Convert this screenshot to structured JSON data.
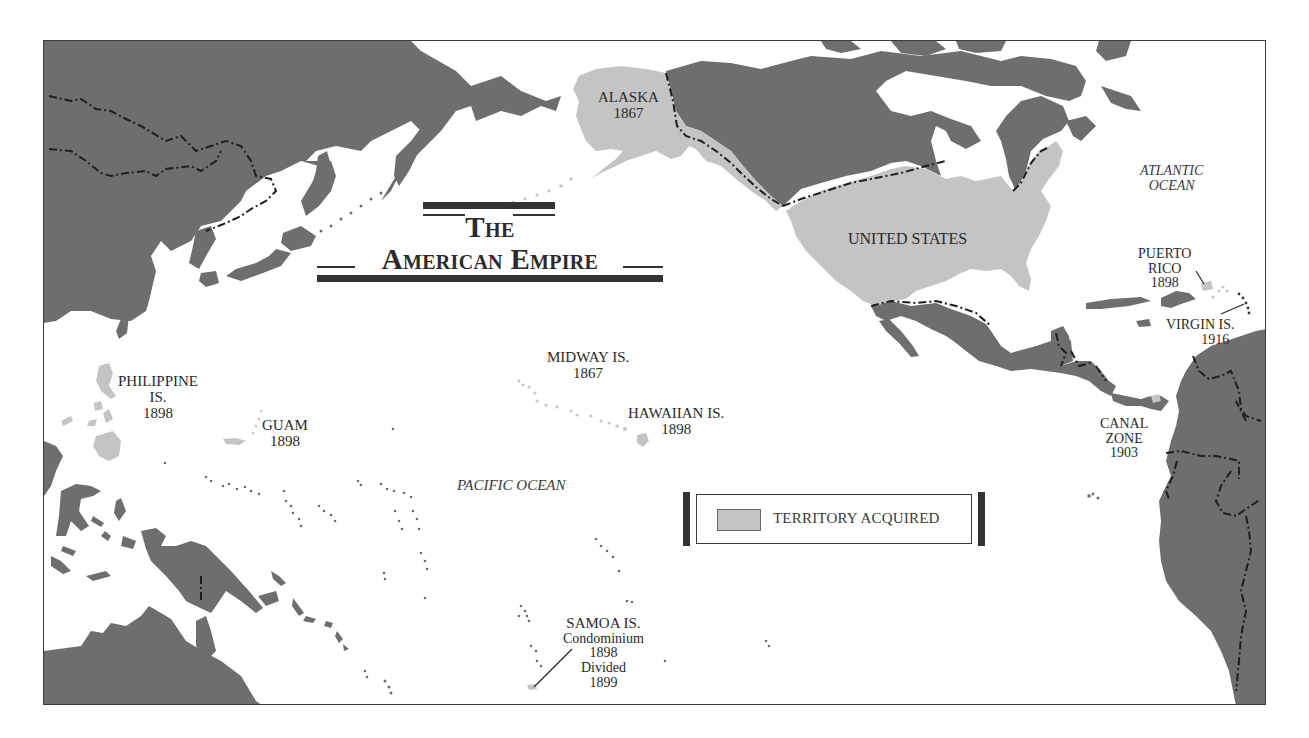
{
  "title": {
    "line1": "The",
    "line2": "American Empire"
  },
  "colors": {
    "foreign_land": "#6e6e6e",
    "territory_acquired": "#c4c4c4",
    "ocean": "#ffffff",
    "border": "#1e1e1e",
    "text": "#2a2a2a"
  },
  "legend": {
    "label": "TERRITORY ACQUIRED",
    "swatch_color": "#c4c4c4"
  },
  "oceans": [
    {
      "id": "pacific",
      "label": "PACIFIC OCEAN"
    },
    {
      "id": "atlantic",
      "line1": "ATLANTIC",
      "line2": "OCEAN"
    }
  ],
  "territories": [
    {
      "id": "alaska",
      "name": "ALASKA",
      "year": "1867"
    },
    {
      "id": "united-states",
      "name": "UNITED STATES"
    },
    {
      "id": "midway",
      "name": "MIDWAY IS.",
      "year": "1867"
    },
    {
      "id": "hawaii",
      "name": "HAWAIIAN IS.",
      "year": "1898"
    },
    {
      "id": "philippines",
      "name_line1": "PHILIPPINE",
      "name_line2": "IS.",
      "year": "1898"
    },
    {
      "id": "guam",
      "name": "GUAM",
      "year": "1898"
    },
    {
      "id": "samoa",
      "name": "SAMOA IS.",
      "status1": "Condominium",
      "year1": "1898",
      "status2": "Divided",
      "year2": "1899"
    },
    {
      "id": "puerto-rico",
      "name_line1": "PUERTO",
      "name_line2": "RICO",
      "year": "1898"
    },
    {
      "id": "virgin-islands",
      "name": "VIRGIN IS.",
      "year": "1916"
    },
    {
      "id": "canal-zone",
      "name_line1": "CANAL",
      "name_line2": "ZONE",
      "year": "1903"
    }
  ]
}
